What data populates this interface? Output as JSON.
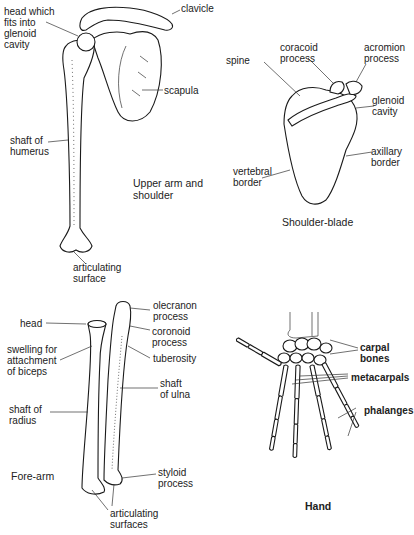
{
  "panels": {
    "upper_arm": {
      "caption": "Upper arm and\nshoulder",
      "labels": {
        "head": "head which\nfits into\nglenoid\ncavity",
        "clavicle": "clavicle",
        "scapula": "scapula",
        "shaft": "shaft of\nhumerus",
        "articulating": "articulating\nsurface"
      }
    },
    "shoulder_blade": {
      "caption": "Shoulder-blade",
      "labels": {
        "coracoid": "coracoid\nprocess",
        "acromion": "acromion\nprocess",
        "spine": "spine",
        "glenoid": "glenoid\ncavity",
        "axillary": "axillary\nborder",
        "vertebral": "vertebral\nborder"
      }
    },
    "fore_arm": {
      "caption": "Fore-arm",
      "labels": {
        "head": "head",
        "swelling": "swelling for\nattachment\nof biceps",
        "shaft_radius": "shaft of\nradius",
        "olecranon": "olecranon\nprocess",
        "coronoid": "coronoid\nprocess",
        "tuberosity": "tuberosity",
        "shaft_ulna": "shaft\nof ulna",
        "styloid": "styloid\nprocess",
        "articulating": "articulating\nsurfaces"
      }
    },
    "hand": {
      "caption": "Hand",
      "labels": {
        "carpal": "carpal\nbones",
        "metacarpals": "metacarpals",
        "phalanges": "phalanges"
      }
    }
  }
}
